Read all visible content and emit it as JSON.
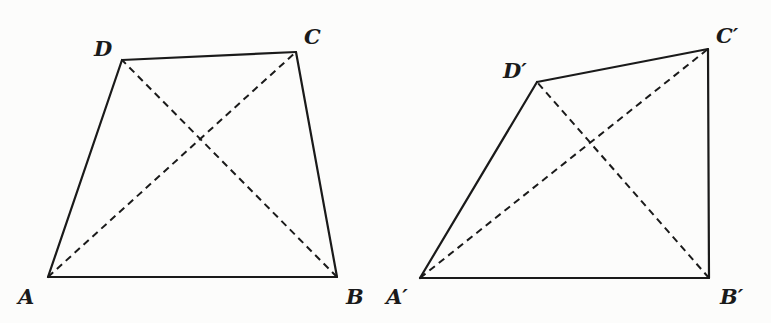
{
  "diagram": {
    "figures": [
      {
        "name": "ABCD",
        "vertices": {
          "A": {
            "label": "A",
            "x": 48,
            "y": 277
          },
          "B": {
            "label": "B",
            "x": 337,
            "y": 277
          },
          "C": {
            "label": "C",
            "x": 296,
            "y": 52
          },
          "D": {
            "label": "D",
            "x": 122,
            "y": 60
          }
        },
        "edges": [
          [
            "A",
            "B"
          ],
          [
            "B",
            "C"
          ],
          [
            "C",
            "D"
          ],
          [
            "D",
            "A"
          ]
        ],
        "diagonals": [
          [
            "A",
            "C"
          ],
          [
            "B",
            "D"
          ]
        ]
      },
      {
        "name": "A'B'C'D'",
        "vertices": {
          "A": {
            "label": "A′",
            "x": 420,
            "y": 278
          },
          "B": {
            "label": "B′",
            "x": 709,
            "y": 278
          },
          "C": {
            "label": "C′",
            "x": 708,
            "y": 49
          },
          "D": {
            "label": "D′",
            "x": 537,
            "y": 82
          }
        },
        "edges": [
          [
            "A",
            "B"
          ],
          [
            "B",
            "C"
          ],
          [
            "C",
            "D"
          ],
          [
            "D",
            "A"
          ]
        ],
        "diagonals": [
          [
            "A",
            "C"
          ],
          [
            "B",
            "D"
          ]
        ]
      }
    ],
    "labels": {
      "A": "A",
      "B": "B",
      "C": "C",
      "D": "D",
      "A_prime": "A′",
      "B_prime": "B′",
      "C_prime": "C′",
      "D_prime": "D′"
    },
    "colors": {
      "line": "#1a1a1a",
      "background": "#fcfcfb"
    }
  }
}
